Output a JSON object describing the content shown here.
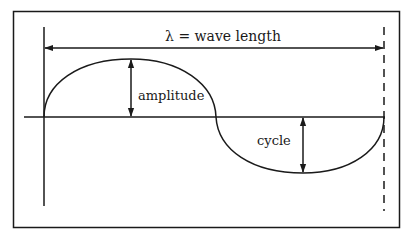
{
  "diagram": {
    "labels": {
      "wavelength": "λ = wave length",
      "amplitude": "amplitude",
      "cycle": "cycle"
    },
    "colors": {
      "stroke": "#1a1a1a",
      "background": "#ffffff"
    },
    "elements": [
      "frame",
      "start-marker-line",
      "end-marker-dashed-line",
      "wavelength-arrow",
      "baseline-axis",
      "wave-crest",
      "wave-trough",
      "amplitude-arrow",
      "cycle-arrow"
    ]
  }
}
